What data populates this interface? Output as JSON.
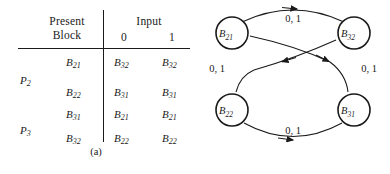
{
  "figure": {
    "panel_a_caption": "(a)",
    "panel_b_caption": "(b)"
  },
  "table": {
    "header_present_block_line1": "Present",
    "header_present_block_line2": "Block",
    "header_input": "Input",
    "input_columns": [
      "0",
      "1"
    ],
    "partitions": [
      {
        "name": "P",
        "sub": "2",
        "rows": [
          {
            "block": "B",
            "block_sub": "21",
            "next_0": "B",
            "next_0_sub": "32",
            "next_1": "B",
            "next_1_sub": "32"
          },
          {
            "block": "B",
            "block_sub": "22",
            "next_0": "B",
            "next_0_sub": "31",
            "next_1": "B",
            "next_1_sub": "31"
          }
        ]
      },
      {
        "name": "P",
        "sub": "3",
        "rows": [
          {
            "block": "B",
            "block_sub": "31",
            "next_0": "B",
            "next_0_sub": "21",
            "next_1": "B",
            "next_1_sub": "21"
          },
          {
            "block": "B",
            "block_sub": "32",
            "next_0": "B",
            "next_0_sub": "22",
            "next_1": "B",
            "next_1_sub": "22"
          }
        ]
      }
    ]
  },
  "graph": {
    "nodes": [
      {
        "id": "B21",
        "label": "B",
        "sub": "21"
      },
      {
        "id": "B32",
        "label": "B",
        "sub": "32"
      },
      {
        "id": "B22",
        "label": "B",
        "sub": "22"
      },
      {
        "id": "B31",
        "label": "B",
        "sub": "31"
      }
    ],
    "edges": [
      {
        "from": "B21",
        "to": "B32",
        "label": "0, 1"
      },
      {
        "from": "B32",
        "to": "B22",
        "label": "0, 1"
      },
      {
        "from": "B22",
        "to": "B31",
        "label": "0, 1"
      },
      {
        "from": "B31",
        "to": "B21",
        "label": "0, 1"
      }
    ]
  },
  "colors": {
    "ink": "#1a1a1a",
    "background": "#ffffff"
  }
}
